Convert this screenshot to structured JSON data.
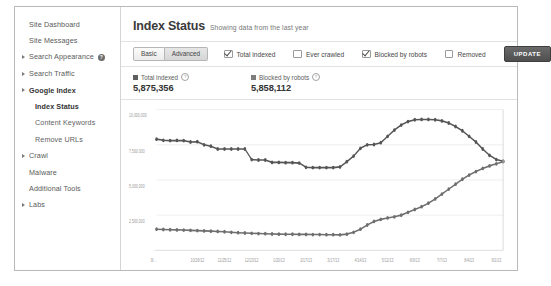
{
  "sidebar": {
    "items": [
      {
        "label": "Site Dashboard",
        "arrow": false,
        "sub": false,
        "active": false,
        "badge": null
      },
      {
        "label": "Site Messages",
        "arrow": false,
        "sub": false,
        "active": false,
        "badge": null
      },
      {
        "label": "Search Appearance",
        "arrow": true,
        "sub": false,
        "active": false,
        "badge": "?"
      },
      {
        "label": "Search Traffic",
        "arrow": true,
        "sub": false,
        "active": false,
        "badge": null
      },
      {
        "label": "Google Index",
        "arrow": true,
        "sub": false,
        "active": true,
        "badge": null
      },
      {
        "label": "Index Status",
        "arrow": false,
        "sub": true,
        "active": true,
        "badge": null
      },
      {
        "label": "Content Keywords",
        "arrow": false,
        "sub": true,
        "active": false,
        "badge": null
      },
      {
        "label": "Remove URLs",
        "arrow": false,
        "sub": true,
        "active": false,
        "badge": null
      },
      {
        "label": "Crawl",
        "arrow": true,
        "sub": false,
        "active": false,
        "badge": null
      },
      {
        "label": "Malware",
        "arrow": false,
        "sub": false,
        "active": false,
        "badge": null
      },
      {
        "label": "Additional Tools",
        "arrow": false,
        "sub": false,
        "active": false,
        "badge": null
      },
      {
        "label": "Labs",
        "arrow": true,
        "sub": false,
        "active": false,
        "badge": null
      }
    ]
  },
  "header": {
    "title": "Index Status",
    "subtitle": "Showing data from the last year"
  },
  "toolbar": {
    "basic_label": "Basic",
    "advanced_label": "Advanced",
    "update_label": "UPDATE",
    "filters": [
      {
        "label": "Total indexed",
        "checked": true
      },
      {
        "label": "Ever crawled",
        "checked": false
      },
      {
        "label": "Blocked by robots",
        "checked": true
      },
      {
        "label": "Removed",
        "checked": false
      }
    ]
  },
  "stats": [
    {
      "label": "Total indexed",
      "value": "5,875,356",
      "color": "#5f5f5f",
      "help": "?"
    },
    {
      "label": "Blocked by robots",
      "value": "5,858,112",
      "color": "#7d7d7d",
      "help": "?"
    }
  ],
  "chart_data": {
    "type": "line",
    "title": "Index Status",
    "xlabel": "",
    "ylabel": "",
    "ylim": [
      0,
      10000000
    ],
    "grid": true,
    "legend_position": "above-chart",
    "ytick_labels": [
      "10,000,000",
      "7,500,000",
      "5,000,000",
      "2,500,000"
    ],
    "yticks": [
      10000000,
      7500000,
      5000000,
      2500000
    ],
    "xtick_labels": [
      "9/...",
      "10/28/12",
      "11/25/12",
      "12/23/12",
      "1/20/13",
      "2/17/13",
      "3/17/13",
      "4/14/13",
      "5/12/13",
      "6/9/13",
      "7/7/13",
      "8/4/13",
      "9/1/13"
    ],
    "series": [
      {
        "name": "Total indexed",
        "color": "#555555",
        "values": [
          7900000,
          7820000,
          7800000,
          7810000,
          7800000,
          7700000,
          7720000,
          7500000,
          7400000,
          7200000,
          7200000,
          7200000,
          7200000,
          7200000,
          6450000,
          6420000,
          6420000,
          6250000,
          6250000,
          6230000,
          6230000,
          6200000,
          5900000,
          5880000,
          5880000,
          5880000,
          5880000,
          5930000,
          6300000,
          6700000,
          7250000,
          7500000,
          7520000,
          7650000,
          8100000,
          8550000,
          8900000,
          9150000,
          9280000,
          9300000,
          9300000,
          9280000,
          9200000,
          9050000,
          8800000,
          8500000,
          8100000,
          7700000,
          7200000,
          6750000,
          6450000,
          6330000
        ]
      },
      {
        "name": "Blocked by robots",
        "color": "#6e6e6e",
        "values": [
          1500000,
          1480000,
          1460000,
          1450000,
          1440000,
          1420000,
          1400000,
          1380000,
          1360000,
          1340000,
          1320000,
          1280000,
          1250000,
          1230000,
          1210000,
          1190000,
          1180000,
          1160000,
          1150000,
          1140000,
          1140000,
          1130000,
          1130000,
          1120000,
          1120000,
          1110000,
          1110000,
          1100000,
          1150000,
          1280000,
          1500000,
          1800000,
          2050000,
          2200000,
          2300000,
          2380000,
          2500000,
          2700000,
          2900000,
          3100000,
          3350000,
          3650000,
          4000000,
          4350000,
          4700000,
          5050000,
          5350000,
          5600000,
          5820000,
          6000000,
          6150000,
          6300000
        ]
      }
    ]
  }
}
